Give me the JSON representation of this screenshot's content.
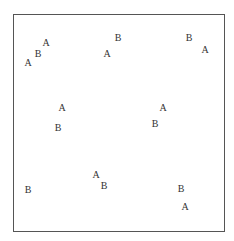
{
  "chart_data": {
    "type": "scatter",
    "title": "",
    "xlabel": "",
    "ylabel": "",
    "grid": false,
    "legend": null,
    "axis_ticks": false,
    "frame": {
      "left": 13,
      "top": 14,
      "right": 224,
      "bottom": 231
    },
    "categories": [
      "A",
      "B"
    ],
    "points": [
      {
        "label": "A",
        "x": 46,
        "y": 43
      },
      {
        "label": "B",
        "x": 38,
        "y": 54
      },
      {
        "label": "A",
        "x": 28,
        "y": 63
      },
      {
        "label": "B",
        "x": 118,
        "y": 38
      },
      {
        "label": "A",
        "x": 107,
        "y": 54
      },
      {
        "label": "B",
        "x": 189,
        "y": 38
      },
      {
        "label": "A",
        "x": 205,
        "y": 50
      },
      {
        "label": "A",
        "x": 62,
        "y": 108
      },
      {
        "label": "B",
        "x": 58,
        "y": 128
      },
      {
        "label": "A",
        "x": 163,
        "y": 108
      },
      {
        "label": "B",
        "x": 155,
        "y": 124
      },
      {
        "label": "B",
        "x": 28,
        "y": 190
      },
      {
        "label": "A",
        "x": 96,
        "y": 175
      },
      {
        "label": "B",
        "x": 104,
        "y": 186
      },
      {
        "label": "B",
        "x": 181,
        "y": 189
      },
      {
        "label": "A",
        "x": 185,
        "y": 207
      }
    ],
    "colors": {
      "text": "#333333",
      "frame": "#555555",
      "background": "#ffffff"
    }
  }
}
